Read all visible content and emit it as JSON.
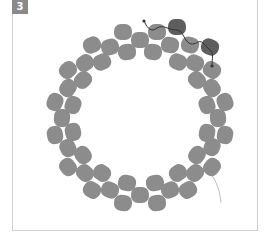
{
  "figure": {
    "step_label": "3",
    "colors": {
      "bead": "#8c8c8c",
      "bead_highlight": "#5e5e5e",
      "thread_active": "#333333",
      "thread_tail": "#bdbdbd",
      "frame_border": "#cfcfcf",
      "step_badge": "#8a8a8a"
    },
    "beads": [
      {
        "x": 123,
        "y": 32,
        "r": 0
      },
      {
        "x": 140,
        "y": 40,
        "r": 0
      },
      {
        "x": 157,
        "y": 32,
        "r": 0
      },
      {
        "x": 177,
        "y": 27,
        "r": 0,
        "highlight": true
      },
      {
        "x": 170,
        "y": 45,
        "r": 10
      },
      {
        "x": 190,
        "y": 45,
        "r": 15
      },
      {
        "x": 210,
        "y": 47,
        "r": 20,
        "highlight": true
      },
      {
        "x": 212,
        "y": 70,
        "r": 30
      },
      {
        "x": 178,
        "y": 62,
        "r": 20
      },
      {
        "x": 195,
        "y": 63,
        "r": 25
      },
      {
        "x": 92,
        "y": 45,
        "r": -25
      },
      {
        "x": 110,
        "y": 47,
        "r": -15
      },
      {
        "x": 127,
        "y": 52,
        "r": -5
      },
      {
        "x": 153,
        "y": 52,
        "r": 5
      },
      {
        "x": 102,
        "y": 62,
        "r": -25
      },
      {
        "x": 85,
        "y": 63,
        "r": -35
      },
      {
        "x": 68,
        "y": 70,
        "r": -40
      },
      {
        "x": 83,
        "y": 80,
        "r": -45
      },
      {
        "x": 68,
        "y": 88,
        "r": -55
      },
      {
        "x": 55,
        "y": 102,
        "r": -70
      },
      {
        "x": 73,
        "y": 105,
        "r": -70
      },
      {
        "x": 62,
        "y": 118,
        "r": -85
      },
      {
        "x": 55,
        "y": 135,
        "r": -100
      },
      {
        "x": 73,
        "y": 132,
        "r": -100
      },
      {
        "x": 68,
        "y": 148,
        "r": -115
      },
      {
        "x": 83,
        "y": 155,
        "r": -125
      },
      {
        "x": 68,
        "y": 167,
        "r": -130
      },
      {
        "x": 85,
        "y": 173,
        "r": -135
      },
      {
        "x": 102,
        "y": 173,
        "r": -145
      },
      {
        "x": 92,
        "y": 190,
        "r": -150
      },
      {
        "x": 110,
        "y": 190,
        "r": -160
      },
      {
        "x": 127,
        "y": 183,
        "r": -170
      },
      {
        "x": 123,
        "y": 203,
        "r": -175
      },
      {
        "x": 140,
        "y": 195,
        "r": 180
      },
      {
        "x": 155,
        "y": 183,
        "r": 170
      },
      {
        "x": 157,
        "y": 203,
        "r": 175
      },
      {
        "x": 170,
        "y": 190,
        "r": 160
      },
      {
        "x": 188,
        "y": 190,
        "r": 150
      },
      {
        "x": 178,
        "y": 173,
        "r": 145
      },
      {
        "x": 195,
        "y": 173,
        "r": 135
      },
      {
        "x": 197,
        "y": 155,
        "r": 125
      },
      {
        "x": 212,
        "y": 167,
        "r": 130
      },
      {
        "x": 212,
        "y": 147,
        "r": 115
      },
      {
        "x": 207,
        "y": 133,
        "r": 100
      },
      {
        "x": 225,
        "y": 135,
        "r": 100
      },
      {
        "x": 218,
        "y": 118,
        "r": 85
      },
      {
        "x": 207,
        "y": 105,
        "r": 70
      },
      {
        "x": 225,
        "y": 102,
        "r": 70
      },
      {
        "x": 212,
        "y": 88,
        "r": 55
      },
      {
        "x": 197,
        "y": 80,
        "r": 45
      }
    ],
    "thread_active_path": "M144 21 C148 30 152 32 157 28 C163 24 168 30 176 30 C182 30 183 36 186 40 C190 46 195 44 198 42 C203 40 205 46 210 50 C214 53 212 58 212 66",
    "thread_tail_path": "M205 168 C214 175 220 188 221 203"
  }
}
